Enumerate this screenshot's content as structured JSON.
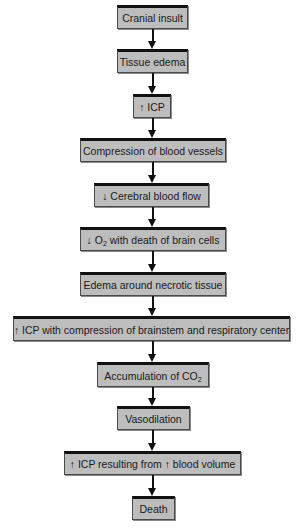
{
  "diagram": {
    "type": "flowchart",
    "direction": "top-to-bottom",
    "colors": {
      "box_fill": "#bdbdbd",
      "box_top_border": "#111111",
      "arrow": "#111111",
      "background": "#ffffff"
    },
    "nodes": [
      {
        "id": "n1",
        "label": "Cranial insult"
      },
      {
        "id": "n2",
        "label": "Tissue edema"
      },
      {
        "id": "n3",
        "label": "↑ ICP"
      },
      {
        "id": "n4",
        "label": "Compression of blood vessels"
      },
      {
        "id": "n5",
        "label": "↓ Cerebral blood flow"
      },
      {
        "id": "n6",
        "label_prefix": "↓ O",
        "label_sub": "2",
        "label_suffix": " with death of brain cells"
      },
      {
        "id": "n7",
        "label": "Edema around necrotic tissue"
      },
      {
        "id": "n8",
        "label": "↑ ICP with compression of brainstem and respiratory center"
      },
      {
        "id": "n9",
        "label_prefix": "Accumulation of CO",
        "label_sub": "2",
        "label_suffix": ""
      },
      {
        "id": "n10",
        "label": "Vasodilation"
      },
      {
        "id": "n11",
        "label": "↑ ICP resulting from ↑ blood volume"
      },
      {
        "id": "n12",
        "label": "Death"
      }
    ],
    "edges": [
      [
        "n1",
        "n2"
      ],
      [
        "n2",
        "n3"
      ],
      [
        "n3",
        "n4"
      ],
      [
        "n4",
        "n5"
      ],
      [
        "n5",
        "n6"
      ],
      [
        "n6",
        "n7"
      ],
      [
        "n7",
        "n8"
      ],
      [
        "n8",
        "n9"
      ],
      [
        "n9",
        "n10"
      ],
      [
        "n10",
        "n11"
      ],
      [
        "n11",
        "n12"
      ]
    ]
  }
}
